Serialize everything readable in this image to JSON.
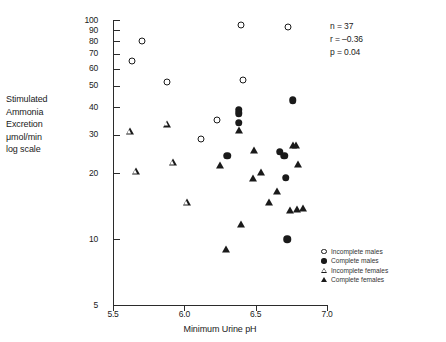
{
  "chart_data": {
    "type": "scatter",
    "title": "",
    "xlabel": "Minimum Urine pH",
    "ylabel_lines": [
      "Stimulated",
      "Ammonia",
      "Excretion",
      "μmol/min",
      "log scale"
    ],
    "xlim": [
      5.4,
      7.05
    ],
    "ylim": [
      5,
      100
    ],
    "yscale": "log",
    "grid": false,
    "xticks": [
      "5.5",
      "6.0",
      "6.5",
      "7.0"
    ],
    "xtick_values": [
      5.5,
      6.0,
      6.5,
      7.0
    ],
    "yticks": [
      "100",
      "90",
      "80",
      "70",
      "60",
      "50",
      "40",
      "30",
      "20",
      "10",
      "5"
    ],
    "ytick_values": [
      100,
      90,
      80,
      70,
      60,
      50,
      40,
      30,
      20,
      10,
      5
    ],
    "legend_position": "bottom-right",
    "annotations": [
      {
        "text": "n = 37"
      },
      {
        "text": "r = –0.36"
      },
      {
        "text": "p = 0.04"
      }
    ],
    "series": [
      {
        "name": "Incomplete males",
        "marker": "open-circle",
        "color": "#1a1a1a",
        "points": [
          {
            "x": 5.63,
            "y": 65
          },
          {
            "x": 5.7,
            "y": 80
          },
          {
            "x": 5.88,
            "y": 52
          },
          {
            "x": 6.23,
            "y": 35
          },
          {
            "x": 6.12,
            "y": 28.5
          },
          {
            "x": 6.4,
            "y": 95
          },
          {
            "x": 6.41,
            "y": 53
          },
          {
            "x": 6.73,
            "y": 93
          }
        ]
      },
      {
        "name": "Complete males",
        "marker": "filled-circle",
        "color": "#1a1a1a",
        "points": [
          {
            "x": 6.3,
            "y": 24
          },
          {
            "x": 6.38,
            "y": 39
          },
          {
            "x": 6.38,
            "y": 37.5
          },
          {
            "x": 6.38,
            "y": 34
          },
          {
            "x": 6.67,
            "y": 25
          },
          {
            "x": 6.7,
            "y": 24
          },
          {
            "x": 6.71,
            "y": 19
          },
          {
            "x": 6.72,
            "y": 10
          },
          {
            "x": 6.76,
            "y": 43
          }
        ]
      },
      {
        "name": "Incomplete females",
        "marker": "open-triangle",
        "color": "#1a1a1a",
        "points": [
          {
            "x": 5.62,
            "y": 31
          },
          {
            "x": 5.66,
            "y": 22
          },
          {
            "x": 5.88,
            "y": 39
          },
          {
            "x": 5.92,
            "y": 28
          },
          {
            "x": 6.02,
            "y": 19.8
          }
        ]
      },
      {
        "name": "Complete females",
        "marker": "filled-triangle",
        "color": "#1a1a1a",
        "points": [
          {
            "x": 6.25,
            "y": 21.8
          },
          {
            "x": 6.29,
            "y": 9
          },
          {
            "x": 6.38,
            "y": 31.5
          },
          {
            "x": 6.4,
            "y": 11.7
          },
          {
            "x": 6.49,
            "y": 25.5
          },
          {
            "x": 6.48,
            "y": 19
          },
          {
            "x": 6.54,
            "y": 20.3
          },
          {
            "x": 6.59,
            "y": 14.7
          },
          {
            "x": 6.65,
            "y": 16.5
          },
          {
            "x": 6.76,
            "y": 27
          },
          {
            "x": 6.78,
            "y": 27
          },
          {
            "x": 6.74,
            "y": 13.6
          },
          {
            "x": 6.79,
            "y": 13.7
          },
          {
            "x": 6.83,
            "y": 13.9
          },
          {
            "x": 6.8,
            "y": 22
          }
        ]
      }
    ]
  }
}
